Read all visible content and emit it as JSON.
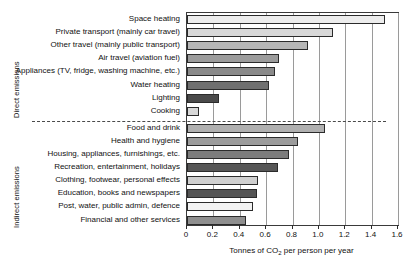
{
  "chart_data": {
    "type": "bar",
    "orientation": "horizontal",
    "title": "",
    "xlabel": "Tonnes of CO2 per person per year",
    "xlabel_parts": {
      "before": "Tonnes of CO",
      "sub": "2",
      "after": " per person per year"
    },
    "ylabel": "",
    "xlim": [
      0,
      1.6
    ],
    "xticks": [
      0,
      0.2,
      0.4,
      0.6,
      0.8,
      1.0,
      1.2,
      1.4,
      1.6
    ],
    "xticklabels": [
      "0",
      "0.2",
      "0.4",
      "0.6",
      "0.8",
      "1.0",
      "1.2",
      "1.4",
      "1.6"
    ],
    "grid": true,
    "grid_axis": "x",
    "legend": "none",
    "groups": [
      {
        "name": "Direct emissions",
        "label": "Direct emissions",
        "start_index": 0,
        "end_index": 7
      },
      {
        "name": "Indirect emissions",
        "label": "Indirect emissions",
        "start_index": 8,
        "end_index": 15
      }
    ],
    "categories": [
      "Space heating",
      "Private transport (mainly car travel)",
      "Other travel (mainly public transport)",
      "Air travel (aviation fuel)",
      "Appliances (TV, fridge, washing machine, etc.)",
      "Water heating",
      "Lighting",
      "Cooking",
      "Food and drink",
      "Health and hygiene",
      "Housing, appliances, furnishings, etc.",
      "Recreation, entertainment, holidays",
      "Clothing, footwear, personal effects",
      "Education, books and newspapers",
      "Post, water, public admin, defence",
      "Financial and other services"
    ],
    "values": [
      1.5,
      1.11,
      0.92,
      0.7,
      0.67,
      0.62,
      0.24,
      0.09,
      1.05,
      0.84,
      0.77,
      0.69,
      0.54,
      0.53,
      0.5,
      0.45
    ],
    "bar_fills": [
      "#ededed",
      "#d8d8d8",
      "#b6b6b6",
      "#9c9c9c",
      "#8a8a8a",
      "#6f6f6f",
      "#4a4a4a",
      "#d8d8d8",
      "#b0b0b0",
      "#9c9c9c",
      "#7c7c7c",
      "#565656",
      "#cfcfcf",
      "#555555",
      "#f2f2f2",
      "#8f8f8f"
    ],
    "bar_edge_color": "#2b2b2b",
    "grid_color": "#9a9a9a",
    "axis_color": "#3a3a3a",
    "separator_style": "dashed"
  }
}
